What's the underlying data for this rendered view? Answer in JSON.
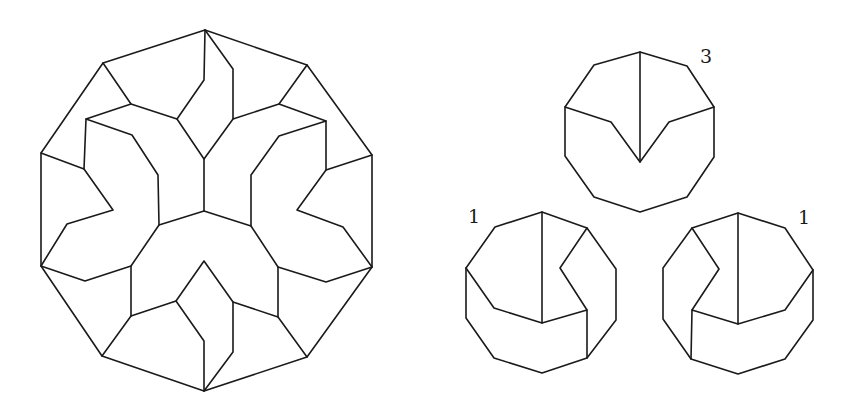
{
  "figure": {
    "line_color": "#1a1a1a",
    "background": "#ffffff"
  },
  "large_decagon": {
    "outline": [
      [
        205,
        30
      ],
      [
        307,
        65
      ],
      [
        372,
        155
      ],
      [
        372,
        267
      ],
      [
        307,
        357
      ],
      [
        204,
        391
      ],
      [
        102,
        356
      ],
      [
        41,
        266
      ],
      [
        41,
        153
      ],
      [
        103,
        63
      ]
    ],
    "segments": [
      [
        [
          205,
          30
        ],
        [
          204,
          80
        ],
        [
          177,
          119
        ],
        [
          131,
          104
        ],
        [
          103,
          63
        ]
      ],
      [
        [
          205,
          30
        ],
        [
          233,
          69
        ],
        [
          233,
          119
        ],
        [
          279,
          104
        ],
        [
          307,
          65
        ]
      ],
      [
        [
          131,
          104
        ],
        [
          86,
          119
        ],
        [
          84,
          169
        ],
        [
          41,
          153
        ]
      ],
      [
        [
          279,
          104
        ],
        [
          326,
          121
        ],
        [
          326,
          170
        ],
        [
          372,
          155
        ]
      ],
      [
        [
          177,
          119
        ],
        [
          204,
          159
        ],
        [
          204,
          211
        ]
      ],
      [
        [
          233,
          119
        ],
        [
          204,
          159
        ]
      ],
      [
        [
          86,
          119
        ],
        [
          132,
          135
        ],
        [
          158,
          175
        ],
        [
          159,
          225
        ],
        [
          204,
          211
        ]
      ],
      [
        [
          326,
          121
        ],
        [
          279,
          136
        ],
        [
          251,
          175
        ],
        [
          251,
          226
        ],
        [
          204,
          211
        ]
      ],
      [
        [
          84,
          169
        ],
        [
          113,
          210
        ],
        [
          67,
          224
        ],
        [
          41,
          266
        ]
      ],
      [
        [
          326,
          170
        ],
        [
          297,
          210
        ],
        [
          343,
          227
        ],
        [
          372,
          267
        ]
      ],
      [
        [
          159,
          225
        ],
        [
          131,
          266
        ],
        [
          85,
          281
        ],
        [
          41,
          266
        ]
      ],
      [
        [
          251,
          226
        ],
        [
          278,
          267
        ],
        [
          326,
          282
        ],
        [
          372,
          267
        ]
      ],
      [
        [
          131,
          266
        ],
        [
          131,
          316
        ],
        [
          102,
          356
        ]
      ],
      [
        [
          278,
          267
        ],
        [
          278,
          317
        ],
        [
          307,
          357
        ]
      ],
      [
        [
          131,
          316
        ],
        [
          176,
          301
        ],
        [
          204,
          261
        ],
        [
          233,
          302
        ],
        [
          278,
          317
        ]
      ],
      [
        [
          176,
          301
        ],
        [
          204,
          341
        ],
        [
          204,
          391
        ]
      ],
      [
        [
          233,
          302
        ],
        [
          233,
          352
        ],
        [
          204,
          391
        ]
      ]
    ]
  },
  "small_decagons": [
    {
      "label": "3",
      "label_pos": [
        700,
        63
      ],
      "outline": [
        [
          640,
          52
        ],
        [
          687,
          66
        ],
        [
          714,
          107
        ],
        [
          714,
          157
        ],
        [
          687,
          197
        ],
        [
          640,
          212
        ],
        [
          594,
          197
        ],
        [
          565,
          156
        ],
        [
          565,
          107
        ],
        [
          594,
          65
        ]
      ],
      "segments": [
        [
          [
            640,
            52
          ],
          [
            640,
            162
          ]
        ],
        [
          [
            565,
            107
          ],
          [
            611,
            122
          ],
          [
            640,
            162
          ],
          [
            669,
            122
          ],
          [
            714,
            107
          ]
        ]
      ]
    },
    {
      "label": "1",
      "label_pos": [
        468,
        223
      ],
      "outline": [
        [
          542,
          212
        ],
        [
          587,
          228
        ],
        [
          616,
          269
        ],
        [
          616,
          320
        ],
        [
          587,
          358
        ],
        [
          542,
          373
        ],
        [
          494,
          358
        ],
        [
          466,
          318
        ],
        [
          466,
          268
        ],
        [
          495,
          227
        ]
      ],
      "segments": [
        [
          [
            542,
            212
          ],
          [
            542,
            323
          ]
        ],
        [
          [
            466,
            268
          ],
          [
            494,
            308
          ],
          [
            542,
            323
          ],
          [
            587,
            310
          ],
          [
            587,
            358
          ]
        ],
        [
          [
            587,
            228
          ],
          [
            560,
            268
          ],
          [
            587,
            310
          ]
        ]
      ]
    },
    {
      "label": "1",
      "label_pos": [
        798,
        224
      ],
      "outline": [
        [
          738,
          213
        ],
        [
          785,
          228
        ],
        [
          813,
          270
        ],
        [
          813,
          320
        ],
        [
          785,
          359
        ],
        [
          738,
          374
        ],
        [
          691,
          359
        ],
        [
          663,
          319
        ],
        [
          663,
          268
        ],
        [
          692,
          228
        ]
      ],
      "segments": [
        [
          [
            738,
            213
          ],
          [
            738,
            324
          ]
        ],
        [
          [
            813,
            270
          ],
          [
            785,
            310
          ],
          [
            738,
            324
          ],
          [
            692,
            310
          ],
          [
            691,
            359
          ]
        ],
        [
          [
            692,
            228
          ],
          [
            719,
            269
          ],
          [
            692,
            310
          ]
        ]
      ]
    }
  ]
}
